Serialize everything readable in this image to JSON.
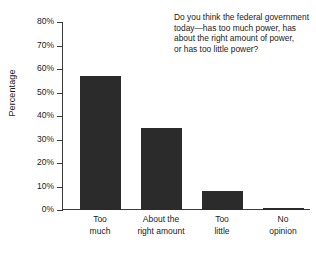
{
  "chart_data": {
    "type": "bar",
    "title": "",
    "xlabel": "",
    "ylabel": "Percentage",
    "ylim": [
      0,
      80
    ],
    "grid": false,
    "legend": "none",
    "categories": [
      "Too much",
      "About the right amount",
      "Too little",
      "No opinion"
    ],
    "values": [
      57,
      35,
      8,
      1
    ],
    "value_unit": "%",
    "ytick_labels": [
      "0%",
      "10%",
      "20%",
      "30%",
      "40%",
      "50%",
      "60%",
      "70%",
      "80%"
    ],
    "ytick_values": [
      0,
      10,
      20,
      30,
      40,
      50,
      60,
      70,
      80
    ],
    "annotation": "Do you think the federal government today—has too much power, has about the right amount of power, or has too little power?",
    "bar_color": "#2b2b2b",
    "axis_color": "#3a3a3a",
    "background_color": "#ffffff"
  },
  "axis": {
    "y_title": "Percentage",
    "ticks": [
      {
        "label": "80%",
        "value": 80
      },
      {
        "label": "70%",
        "value": 70
      },
      {
        "label": "60%",
        "value": 60
      },
      {
        "label": "50%",
        "value": 50
      },
      {
        "label": "40%",
        "value": 40
      },
      {
        "label": "30%",
        "value": 30
      },
      {
        "label": "20%",
        "value": 20
      },
      {
        "label": "10%",
        "value": 10
      },
      {
        "label": "0%",
        "value": 0
      }
    ]
  },
  "bars": [
    {
      "label_line1": "Too",
      "label_line2": "much",
      "value": 57
    },
    {
      "label_line1": "About the",
      "label_line2": "right amount",
      "value": 35
    },
    {
      "label_line1": "Too",
      "label_line2": "little",
      "value": 8
    },
    {
      "label_line1": "No",
      "label_line2": "opinion",
      "value": 1
    }
  ],
  "question": {
    "line1": "Do you think the federal government",
    "line2": "today—has too much power, has",
    "line3": "about the right amount of power,",
    "line4": "or has too little power?"
  }
}
